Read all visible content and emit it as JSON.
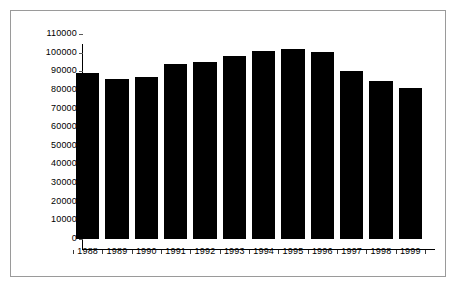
{
  "chart_data": {
    "type": "bar",
    "title": "",
    "subtitle": "",
    "xlabel": "",
    "ylabel": "",
    "categories": [
      "1988",
      "1989",
      "1990",
      "1991",
      "1992",
      "1993",
      "1994",
      "1995",
      "1996",
      "1997",
      "1998",
      "1999"
    ],
    "values": [
      89000,
      86000,
      87000,
      94000,
      95000,
      98000,
      101000,
      102000,
      100500,
      90000,
      85000,
      81000
    ],
    "series": [
      {
        "name": "",
        "values": [
          89000,
          86000,
          87000,
          94000,
          95000,
          98000,
          101000,
          102000,
          100500,
          90000,
          85000,
          81000
        ]
      }
    ],
    "ylim": [
      0,
      110000
    ],
    "xlim": [
      0,
      12
    ],
    "ytick_labels": [
      "110000",
      "100000",
      "90000",
      "80000",
      "70000",
      "60000",
      "50000",
      "40000",
      "30000",
      "20000",
      "10000",
      "0"
    ],
    "ytick_values": [
      110000,
      100000,
      90000,
      80000,
      70000,
      60000,
      50000,
      40000,
      30000,
      20000,
      10000,
      0
    ],
    "xtick_labels": [
      "1988",
      "1989",
      "1990",
      "1991",
      "1992",
      "1993",
      "1994",
      "1995",
      "1996",
      "1997",
      "1998",
      "1999"
    ],
    "grid": false,
    "legend": null,
    "legend_position": "none",
    "annotations": [],
    "colors": {
      "bar": "#000000",
      "axis": "#000000",
      "tick_text": "#000000",
      "frame_border": "#9a9a9a",
      "background": "#ffffff"
    }
  }
}
